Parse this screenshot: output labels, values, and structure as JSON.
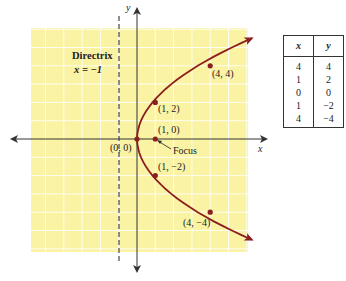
{
  "figure": {
    "axes": {
      "x_label": "x",
      "y_label": "y"
    },
    "directrix": {
      "title": "Directrix",
      "equation": "x = −1"
    },
    "points": [
      {
        "label": "(4, 4)",
        "x": 4,
        "y": 4
      },
      {
        "label": "(1, 2)",
        "x": 1,
        "y": 2
      },
      {
        "label": "(1, 0)",
        "x": 1,
        "y": 0
      },
      {
        "label": "(0, 0)",
        "x": 0,
        "y": 0
      },
      {
        "label": "(1, −2)",
        "x": 1,
        "y": -2
      },
      {
        "label": "(4, −4)",
        "x": 4,
        "y": -4
      }
    ],
    "focus_label": "Focus",
    "colors": {
      "grid_bg": "#fbf3a4",
      "grid_line": "#ffffff",
      "curve": "#8b1e1e",
      "axis": "#333333"
    }
  },
  "table": {
    "headers": [
      "x",
      "y"
    ],
    "rows": [
      [
        "4",
        "4"
      ],
      [
        "1",
        "2"
      ],
      [
        "0",
        "0"
      ],
      [
        "1",
        "−2"
      ],
      [
        "4",
        "−4"
      ]
    ]
  }
}
